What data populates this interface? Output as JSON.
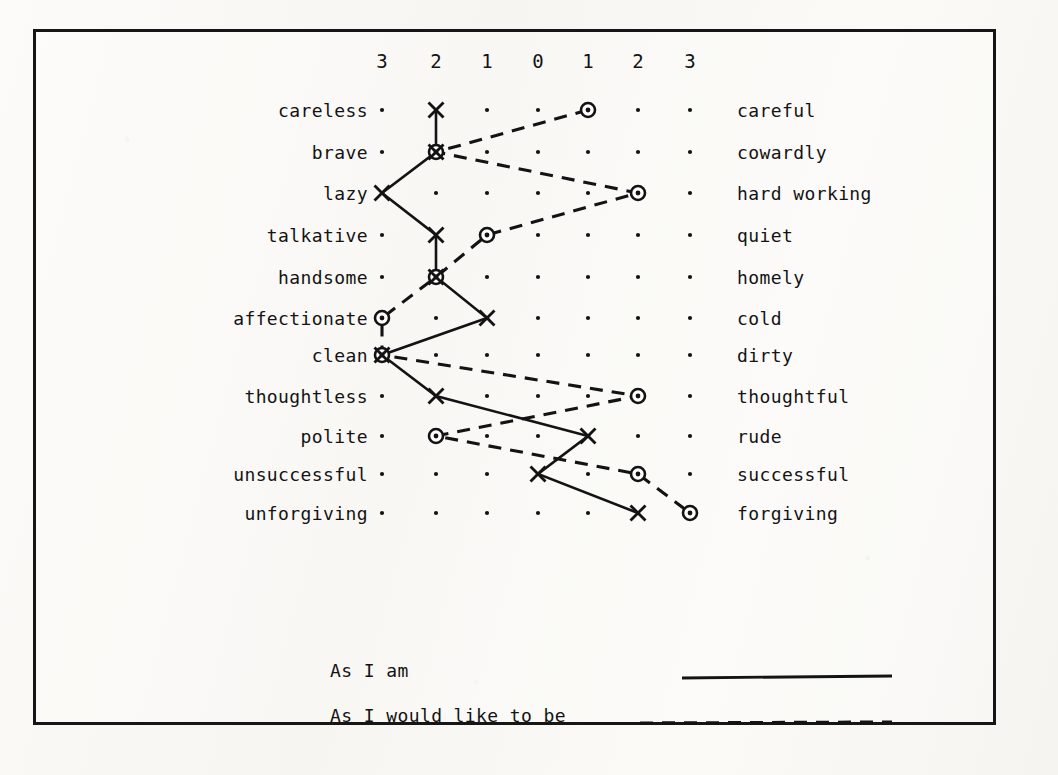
{
  "figure": {
    "scale_header": [
      "3",
      "2",
      "1",
      "0",
      "1",
      "2",
      "3"
    ],
    "legend": {
      "solid_label": "As I am",
      "dashed_label": "As I would like to be"
    },
    "colors": {
      "ink": "#131313",
      "paper": "#fbfaf8",
      "frame": "#161616"
    }
  },
  "chart_data": {
    "type": "line",
    "title": "",
    "subtitle": "",
    "xlabel": "",
    "ylabel": "",
    "xlim": [
      -3,
      3
    ],
    "grid": true,
    "grid_style": "dot-matrix",
    "legend_position": "bottom",
    "x_tick_labels": [
      "3",
      "2",
      "1",
      "0",
      "1",
      "2",
      "3"
    ],
    "x_tick_values": [
      -3,
      -2,
      -1,
      0,
      1,
      2,
      3
    ],
    "categories": [
      "careless / careful",
      "brave / cowardly",
      "lazy / hard working",
      "talkative / quiet",
      "handsome / homely",
      "affectionate / cold",
      "clean / dirty",
      "thoughtless / thoughtful",
      "polite / rude",
      "unsuccessful / successful",
      "unforgiving / forgiving"
    ],
    "left_labels": [
      "careless",
      "brave",
      "lazy",
      "talkative",
      "handsome",
      "affectionate",
      "clean",
      "thoughtless",
      "polite",
      "unsuccessful",
      "unforgiving"
    ],
    "right_labels": [
      "careful",
      "cowardly",
      "hard working",
      "quiet",
      "homely",
      "cold",
      "dirty",
      "thoughtful",
      "rude",
      "successful",
      "forgiving"
    ],
    "series": [
      {
        "name": "As I am",
        "marker": "x",
        "line": "solid",
        "values": [
          -2,
          -2,
          -3,
          -2,
          -2,
          -1,
          -3,
          -2,
          1,
          0,
          2
        ]
      },
      {
        "name": "As I would like to be",
        "marker": "circle",
        "line": "dashed",
        "values": [
          1,
          -2,
          2,
          -1,
          -2,
          -3,
          -3,
          2,
          -2,
          2,
          3
        ]
      }
    ]
  }
}
